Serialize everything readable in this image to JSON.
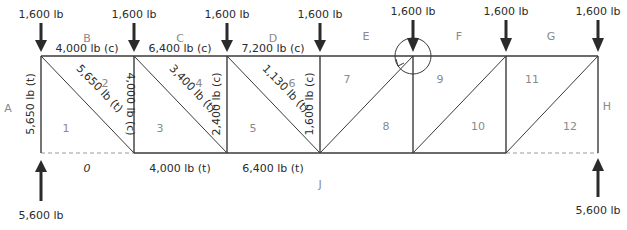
{
  "colors": {
    "line": "#3a3a3a",
    "text": "#2b2b2b",
    "zone_text": "#8a8a8a",
    "dash": "#9a9a9a"
  },
  "loads": [
    {
      "x": 41,
      "label": "1,600 lb"
    },
    {
      "x": 134,
      "label": "1,600 lb"
    },
    {
      "x": 227,
      "label": "1,600 lb"
    },
    {
      "x": 320,
      "label": "1,600 lb"
    },
    {
      "x": 413,
      "label": "1,600 lb"
    },
    {
      "x": 506,
      "label": "1,600 lb"
    },
    {
      "x": 598,
      "label": "1,600 lb"
    }
  ],
  "reactions": [
    {
      "x": 41,
      "label": "5,600 lb"
    },
    {
      "x": 598,
      "label": "5,600 lb"
    }
  ],
  "outer_zones": [
    {
      "id": "A",
      "x": 8,
      "y": 108
    },
    {
      "id": "B",
      "x": 87,
      "y": 42
    },
    {
      "id": "C",
      "x": 180,
      "y": 42
    },
    {
      "id": "D",
      "x": 273,
      "y": 42
    },
    {
      "id": "E",
      "x": 366,
      "y": 40
    },
    {
      "id": "F",
      "x": 459,
      "y": 40
    },
    {
      "id": "G",
      "x": 551,
      "y": 40
    },
    {
      "id": "H",
      "x": 607,
      "y": 106
    },
    {
      "id": "J",
      "x": 320,
      "y": 188
    }
  ],
  "inner_zones": [
    {
      "id": "1",
      "x": 66,
      "y": 128
    },
    {
      "id": "2",
      "x": 105,
      "y": 87
    },
    {
      "id": "3",
      "x": 160,
      "y": 128
    },
    {
      "id": "4",
      "x": 199,
      "y": 87
    },
    {
      "id": "5",
      "x": 253,
      "y": 128
    },
    {
      "id": "6",
      "x": 292,
      "y": 87
    },
    {
      "id": "7",
      "x": 347,
      "y": 83
    },
    {
      "id": "8",
      "x": 386,
      "y": 130
    },
    {
      "id": "9",
      "x": 440,
      "y": 83
    },
    {
      "id": "10",
      "x": 478,
      "y": 130
    },
    {
      "id": "11",
      "x": 532,
      "y": 83
    },
    {
      "id": "12",
      "x": 570,
      "y": 130
    }
  ],
  "top_chord_forces": [
    {
      "x": 87,
      "label": "4,000 lb (c)"
    },
    {
      "x": 180,
      "label": "6,400 lb (c)"
    },
    {
      "x": 273,
      "label": "7,200 lb (c)"
    }
  ],
  "bottom_chord_forces": [
    {
      "x": 87,
      "label": "0"
    },
    {
      "x": 180,
      "label": "4,000 lb (t)"
    },
    {
      "x": 273,
      "label": "6,400 lb (t)"
    }
  ],
  "vertical_forces": [
    {
      "x": 31,
      "y": 104,
      "label": "5,650 lb (t)"
    },
    {
      "x": 124,
      "y": 104,
      "label": "4,000 lb (c)"
    },
    {
      "x": 217,
      "y": 104,
      "label": "2,400 lb (c)"
    },
    {
      "x": 310,
      "y": 104,
      "label": "1,600 lb (c)"
    }
  ],
  "diagonal_forces": [
    {
      "x": 98,
      "y": 91,
      "label": "5,650 lb (t)"
    },
    {
      "x": 191,
      "y": 91,
      "label": "3,400 lb (t)"
    },
    {
      "x": 284,
      "y": 91,
      "label": "1,130 lb (t)"
    }
  ],
  "moment_symbol": {
    "cx": 413,
    "cy": 56,
    "r": 18,
    "note": "joint rotation indicator"
  }
}
